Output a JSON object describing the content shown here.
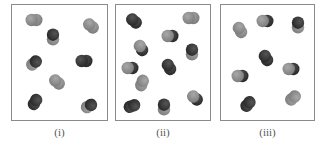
{
  "panels": [
    {
      "label": "(i)",
      "x": 11,
      "w": 97,
      "molecules": [
        {
          "cx": 22,
          "cy": 15,
          "angle": 0,
          "a": "light",
          "b": "light"
        },
        {
          "cx": 79,
          "cy": 21,
          "angle": 40,
          "a": "light",
          "b": "light"
        },
        {
          "cx": 41,
          "cy": 32,
          "angle": 90,
          "a": "dark",
          "b": "light"
        },
        {
          "cx": 22,
          "cy": 58,
          "angle": 140,
          "a": "dark",
          "b": "light"
        },
        {
          "cx": 72,
          "cy": 56,
          "angle": 0,
          "a": "dark",
          "b": "dark"
        },
        {
          "cx": 45,
          "cy": 77,
          "angle": 40,
          "a": "light",
          "b": "light"
        },
        {
          "cx": 23,
          "cy": 97,
          "angle": 120,
          "a": "dark",
          "b": "dark"
        },
        {
          "cx": 77,
          "cy": 101,
          "angle": 150,
          "a": "dark",
          "b": "light"
        }
      ]
    },
    {
      "label": "(ii)",
      "x": 115,
      "w": 96,
      "molecules": [
        {
          "cx": 18,
          "cy": 16,
          "angle": 40,
          "a": "dark",
          "b": "dark"
        },
        {
          "cx": 75,
          "cy": 13,
          "angle": 0,
          "a": "light",
          "b": "light"
        },
        {
          "cx": 54,
          "cy": 31,
          "angle": 0,
          "a": "light",
          "b": "dark"
        },
        {
          "cx": 25,
          "cy": 43,
          "angle": 60,
          "a": "light",
          "b": "dark"
        },
        {
          "cx": 76,
          "cy": 47,
          "angle": 90,
          "a": "dark",
          "b": "light"
        },
        {
          "cx": 14,
          "cy": 63,
          "angle": 0,
          "a": "light",
          "b": "dark"
        },
        {
          "cx": 53,
          "cy": 62,
          "angle": 60,
          "a": "dark",
          "b": "dark"
        },
        {
          "cx": 26,
          "cy": 78,
          "angle": 110,
          "a": "light",
          "b": "light"
        },
        {
          "cx": 16,
          "cy": 101,
          "angle": 160,
          "a": "dark",
          "b": "dark"
        },
        {
          "cx": 48,
          "cy": 102,
          "angle": 90,
          "a": "dark",
          "b": "light"
        },
        {
          "cx": 79,
          "cy": 93,
          "angle": 40,
          "a": "light",
          "b": "dark"
        }
      ]
    },
    {
      "label": "(iii)",
      "x": 220,
      "w": 95,
      "molecules": [
        {
          "cx": 19,
          "cy": 25,
          "angle": 60,
          "a": "light",
          "b": "light"
        },
        {
          "cx": 44,
          "cy": 16,
          "angle": 0,
          "a": "light",
          "b": "dark"
        },
        {
          "cx": 77,
          "cy": 20,
          "angle": 90,
          "a": "dark",
          "b": "light"
        },
        {
          "cx": 45,
          "cy": 53,
          "angle": 60,
          "a": "dark",
          "b": "dark"
        },
        {
          "cx": 19,
          "cy": 71,
          "angle": 0,
          "a": "light",
          "b": "dark"
        },
        {
          "cx": 70,
          "cy": 64,
          "angle": 0,
          "a": "light",
          "b": "dark"
        },
        {
          "cx": 27,
          "cy": 99,
          "angle": 130,
          "a": "dark",
          "b": "dark"
        },
        {
          "cx": 72,
          "cy": 93,
          "angle": 140,
          "a": "light",
          "b": "light"
        }
      ]
    }
  ],
  "colors": {
    "light": "#8c8c8c",
    "dark": "#3a3a3a",
    "border": "#8a8a8a",
    "label": "#555555"
  }
}
